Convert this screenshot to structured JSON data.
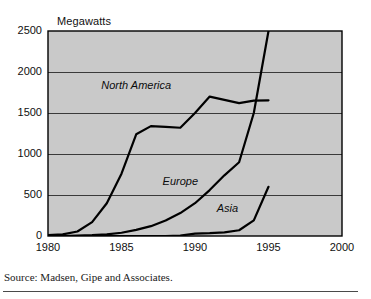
{
  "chart_data": {
    "type": "line",
    "title": "Megawatts",
    "xlabel": "",
    "ylabel": "Megawatts",
    "xlim": [
      1980,
      2000
    ],
    "ylim": [
      0,
      2500
    ],
    "grid": true,
    "legend_position": "inline-labels",
    "xticks": [
      1980,
      1985,
      1990,
      1995,
      2000
    ],
    "yticks": [
      0,
      500,
      1000,
      1500,
      2000,
      2500
    ],
    "plot_background": "#c9c9c9",
    "line_color": "#000000",
    "series": [
      {
        "name": "North America",
        "label_x": 1986.0,
        "label_y": 1830,
        "x": [
          1980,
          1981,
          1982,
          1983,
          1984,
          1985,
          1986,
          1987,
          1988,
          1989,
          1990,
          1991,
          1992,
          1993,
          1994,
          1995
        ],
        "values": [
          10,
          20,
          55,
          170,
          400,
          760,
          1240,
          1340,
          1330,
          1320,
          1500,
          1700,
          1660,
          1620,
          1650,
          1655
        ]
      },
      {
        "name": "Europe",
        "label_x": 1989.0,
        "label_y": 660,
        "x": [
          1980,
          1981,
          1982,
          1983,
          1984,
          1985,
          1986,
          1987,
          1988,
          1989,
          1990,
          1991,
          1992,
          1993,
          1994,
          1995
        ],
        "values": [
          0,
          0,
          5,
          10,
          20,
          40,
          75,
          120,
          190,
          280,
          400,
          560,
          740,
          900,
          1500,
          2500
        ]
      },
      {
        "name": "Asia",
        "label_x": 1992.2,
        "label_y": 330,
        "x": [
          1980,
          1985,
          1988,
          1989,
          1990,
          1991,
          1992,
          1993,
          1994,
          1995
        ],
        "values": [
          0,
          0,
          0,
          5,
          30,
          35,
          45,
          70,
          190,
          600
        ]
      }
    ],
    "annotations": []
  },
  "source": {
    "text": "Source: Madsen, Gipe and Associates."
  }
}
